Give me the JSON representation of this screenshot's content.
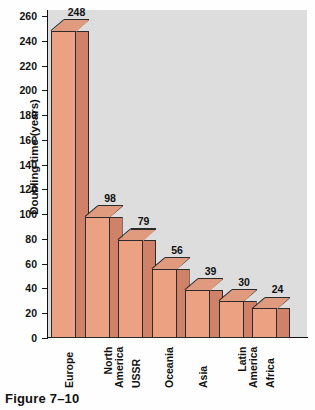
{
  "figure": {
    "caption": "Figure 7–10"
  },
  "chart_data": {
    "type": "bar",
    "title": "",
    "xlabel": "",
    "ylabel": "Doubling time (years)",
    "ylim": [
      0,
      260
    ],
    "grid": false,
    "legend": "none",
    "style": "3d-bar",
    "categories": [
      "Europe",
      "North America",
      "USSR",
      "Oceania",
      "Asia",
      "Latin America",
      "Africa"
    ],
    "category_lines": [
      [
        "Europe"
      ],
      [
        "North",
        "America"
      ],
      [
        "USSR"
      ],
      [
        "Oceania"
      ],
      [
        "Asia"
      ],
      [
        "Latin",
        "America"
      ],
      [
        "Africa"
      ]
    ],
    "values": [
      248,
      98,
      79,
      56,
      39,
      30,
      24
    ],
    "value_labels": [
      "248",
      "98",
      "79",
      "56",
      "39",
      "30",
      "24"
    ],
    "yticks": [
      0,
      20,
      40,
      60,
      80,
      100,
      120,
      140,
      160,
      180,
      200,
      220,
      240,
      260
    ],
    "ytick_labels": [
      "0",
      "20",
      "40",
      "60",
      "80",
      "100",
      "120",
      "140",
      "160",
      "180",
      "200",
      "220",
      "240",
      "260"
    ],
    "colors": {
      "bar_front": "#eda183",
      "bar_side": "#cf8268",
      "bar_top": "#e09a7e",
      "outline": "#2b2b2b",
      "plot_background": "#dddddd",
      "axis": "#111111",
      "page_background": "#fefefe"
    }
  }
}
